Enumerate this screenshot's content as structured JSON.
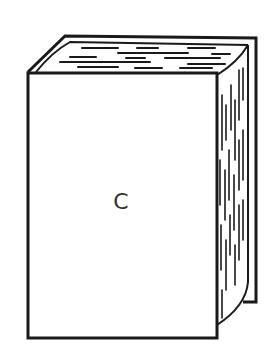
{
  "figure": {
    "front_label": "C",
    "colors": {
      "background": "#ffffff",
      "line": "#1a1a1a",
      "label": "#333333"
    }
  }
}
